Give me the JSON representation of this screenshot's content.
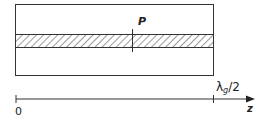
{
  "diagram": {
    "marker_label": "P",
    "axis": {
      "start_label": "0",
      "end_label_symbol": "λ",
      "end_label_subscript": "g",
      "end_label_suffix": "/2",
      "axis_name": "z"
    },
    "colors": {
      "line": "#333333",
      "hatch": "#444444",
      "background": "#ffffff"
    }
  }
}
